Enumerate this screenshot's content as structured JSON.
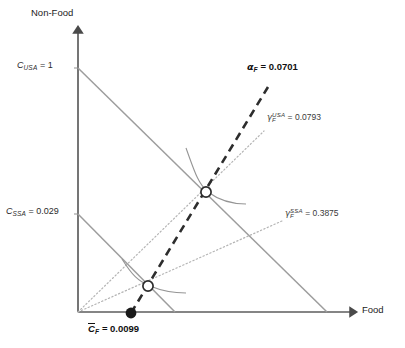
{
  "figure": {
    "type": "economics-indifference-curve-diagram",
    "background_color": "#ffffff",
    "axis_color": "#595959",
    "budget_line_color": "#9a9a9a",
    "ray_color": "#b0b0b0",
    "expansion_path_color": "#2b2b2b",
    "curve_color": "#8a8a8a"
  },
  "axes": {
    "y_label": "Non-Food",
    "x_label": "Food",
    "origin": {
      "x": 78,
      "y": 312
    },
    "y_top": {
      "x": 78,
      "y": 28
    },
    "x_right": {
      "x": 355,
      "y": 312
    }
  },
  "intercepts": [
    {
      "name": "usa-intercept",
      "symbol": "C",
      "subscript": "USA",
      "value": "1",
      "text": "C_USA = 1",
      "label_x": 16,
      "label_y": 62,
      "point": {
        "x": 78,
        "y": 68
      }
    },
    {
      "name": "ssa-intercept",
      "symbol": "C",
      "subscript": "SSA",
      "value": "0.029",
      "text": "C_SSA = 0.029",
      "label_x": 6,
      "label_y": 208,
      "point": {
        "x": 78,
        "y": 214
      }
    }
  ],
  "budget_lines": [
    {
      "name": "usa-budget-line",
      "from": {
        "x": 78,
        "y": 68
      },
      "to": {
        "x": 327,
        "y": 312
      }
    },
    {
      "name": "ssa-budget-line",
      "from": {
        "x": 78,
        "y": 214
      },
      "to": {
        "x": 175,
        "y": 312
      }
    }
  ],
  "rays": [
    {
      "name": "gamma-usa-ray",
      "symbol": "gamma",
      "subscript": "F",
      "superscript": "USA",
      "value": "0.0793",
      "text": "gamma_F^USA = 0.0793",
      "label_x": 267,
      "label_y": 112,
      "from": {
        "x": 78,
        "y": 312
      },
      "to": {
        "x": 264,
        "y": 131
      }
    },
    {
      "name": "gamma-ssa-ray",
      "symbol": "gamma",
      "subscript": "F",
      "superscript": "SSA",
      "value": "0.3875",
      "text": "gamma_F^SSA = 0.3875",
      "label_x": 285,
      "label_y": 208,
      "from": {
        "x": 78,
        "y": 312
      },
      "to": {
        "x": 282,
        "y": 221
      }
    }
  ],
  "expansion_path": {
    "name": "alpha-expansion-path",
    "symbol": "alpha",
    "subscript": "F",
    "value": "0.0701",
    "text": "alpha_F = 0.0701",
    "label_x": 246,
    "label_y": 63,
    "from": {
      "x": 131,
      "y": 313
    },
    "to": {
      "x": 268,
      "y": 87
    }
  },
  "subsistence": {
    "name": "subsistence-point",
    "symbol": "C",
    "overbar": true,
    "subscript": "F",
    "value": "0.0099",
    "text": "Cbar_F = 0.0099",
    "label_x": 86,
    "label_y": 322,
    "point": {
      "x": 131,
      "y": 313
    },
    "marker": "filled-circle"
  },
  "equilibria": [
    {
      "name": "usa-equilibrium-point",
      "point": {
        "x": 206,
        "y": 192
      },
      "marker": "open-circle"
    },
    {
      "name": "ssa-equilibrium-point",
      "point": {
        "x": 148,
        "y": 286
      },
      "marker": "open-circle"
    }
  ],
  "indifference_curves": [
    {
      "name": "usa-indifference-curve",
      "tangent_at": {
        "x": 206,
        "y": 192
      }
    },
    {
      "name": "ssa-indifference-curve",
      "tangent_at": {
        "x": 148,
        "y": 286
      }
    }
  ],
  "labels": {
    "y_axis": "Non-Food",
    "x_axis": "Food",
    "usa_intercept_symbol": "C",
    "usa_intercept_sub": "USA",
    "usa_intercept_eq": "= 1",
    "ssa_intercept_symbol": "C",
    "ssa_intercept_sub": "SSA",
    "ssa_intercept_eq": "= 0.029",
    "alpha_symbol": "α",
    "alpha_sub": "F",
    "alpha_eq": "= 0.0701",
    "gamma_symbol": "γ",
    "gamma_sub": "F",
    "gamma_usa_sup": "USA",
    "gamma_usa_eq": "= 0.0793",
    "gamma_ssa_sup": "SSA",
    "gamma_ssa_eq": "= 0.3875",
    "cbar_symbol": "C",
    "cbar_sub": "F",
    "cbar_eq": "= 0.0099"
  }
}
